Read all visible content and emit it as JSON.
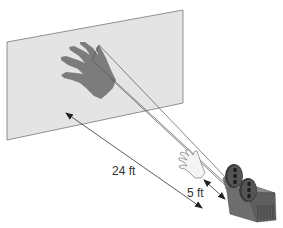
{
  "diagram": {
    "labels": {
      "screen_distance": "24 ft",
      "hand_distance": "5 ft"
    },
    "elements": {
      "screen": "projection-screen",
      "shadow": "hand-shadow",
      "hand": "hand",
      "projector": "film-projector"
    },
    "colors": {
      "screen_fill": "#e4e4e4",
      "screen_edge": "#777777",
      "shadow": "#7a7a7a",
      "hand_fill": "#f2f2f2",
      "projector_body": "#6e6e6e",
      "reel": "#3a3a3a",
      "ray": "#555555",
      "arrow": "#333333"
    }
  }
}
